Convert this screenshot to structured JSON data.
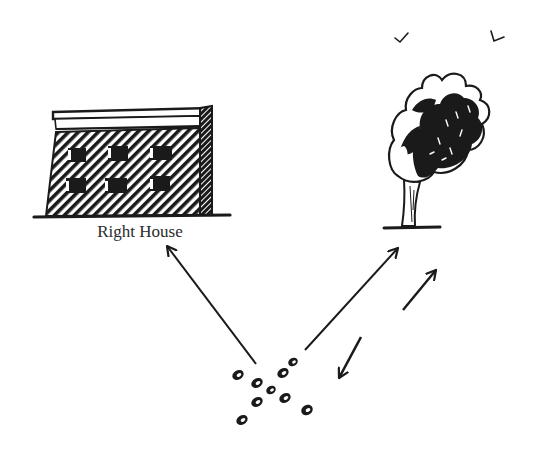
{
  "diagram": {
    "type": "illustration",
    "colors": {
      "ink": "#1a1a1a",
      "background": "#ffffff"
    },
    "nodes": [
      {
        "id": "building",
        "icon": "building-icon",
        "label": "Right House"
      },
      {
        "id": "tree",
        "icon": "windblown-tree-icon",
        "label": ""
      },
      {
        "id": "dots",
        "icon": "dot-cluster-icon",
        "label": "",
        "count": 10
      }
    ],
    "edges": [
      {
        "from": "dots",
        "to": "building",
        "style": "arrow"
      },
      {
        "from": "dots",
        "to": "tree",
        "style": "arrow"
      }
    ],
    "annotations": [
      {
        "icon": "arrow-up-right-icon",
        "meaning": "movement toward tree"
      },
      {
        "icon": "arrow-down-left-icon",
        "meaning": "movement back toward dots"
      },
      {
        "icon": "bird-icon",
        "count": 2
      }
    ]
  },
  "labels": {
    "building": "Right House"
  }
}
